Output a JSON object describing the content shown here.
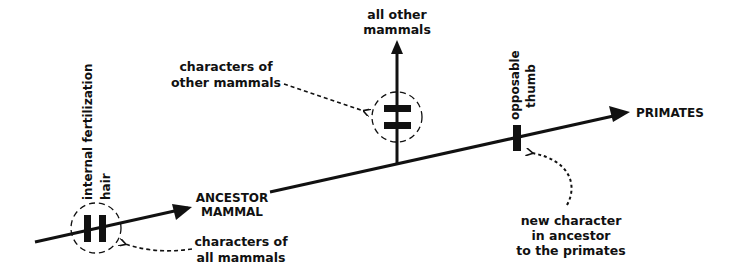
{
  "diagram": {
    "colors": {
      "ink": "#111111",
      "background": "#ffffff"
    },
    "nodes": {
      "ancestor": [
        "ANCESTOR",
        "MAMMAL"
      ],
      "other_mammals": [
        "all other",
        "mammals"
      ],
      "primates": "PRIMATES"
    },
    "characters": {
      "all_mammals_traits": [
        "internal fertilization",
        "hair"
      ],
      "primate_traits": [
        "opposable",
        "thumb"
      ]
    },
    "annotations": {
      "all_mammals": [
        "characters of",
        "all mammals"
      ],
      "other_mammals": [
        "characters of",
        "other mammals"
      ],
      "new_character": [
        "new character",
        "in ancestor",
        "to the primates"
      ]
    }
  }
}
